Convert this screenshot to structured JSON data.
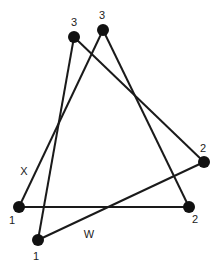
{
  "diagram": {
    "nodes": [
      {
        "id": "A",
        "label": "3",
        "x": 74,
        "y": 37,
        "lx": 74,
        "ly": 26
      },
      {
        "id": "B",
        "label": "3",
        "x": 103,
        "y": 30,
        "lx": 102,
        "ly": 19
      },
      {
        "id": "C",
        "label": "2",
        "x": 204,
        "y": 162,
        "lx": 203,
        "ly": 152
      },
      {
        "id": "D",
        "label": "2",
        "x": 189,
        "y": 207,
        "lx": 195,
        "ly": 223
      },
      {
        "id": "E",
        "label": "1",
        "x": 19,
        "y": 207,
        "lx": 12,
        "ly": 224
      },
      {
        "id": "F",
        "label": "1",
        "x": 38,
        "y": 240,
        "lx": 36,
        "ly": 260
      }
    ],
    "edges": [
      {
        "from": "E",
        "to": "B"
      },
      {
        "from": "F",
        "to": "A"
      },
      {
        "from": "A",
        "to": "C"
      },
      {
        "from": "B",
        "to": "D"
      },
      {
        "from": "E",
        "to": "D"
      },
      {
        "from": "F",
        "to": "C"
      }
    ],
    "annotations": [
      {
        "text": "X",
        "x": 24,
        "y": 175
      },
      {
        "text": "W",
        "x": 89,
        "y": 238
      }
    ],
    "node_color": "#111111",
    "edge_color": "#1a1a1a"
  }
}
